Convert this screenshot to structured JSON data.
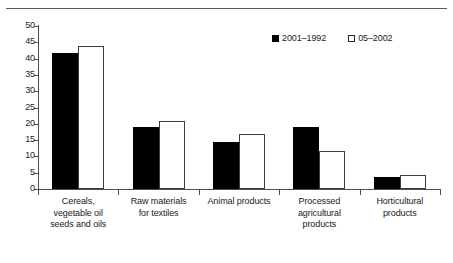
{
  "chart_data": {
    "type": "bar",
    "title": "",
    "subtitle": "",
    "xlabel": "",
    "ylabel": "",
    "ylim": [
      0,
      50
    ],
    "yticks": [
      0,
      5,
      10,
      15,
      20,
      25,
      30,
      35,
      40,
      45,
      50
    ],
    "ytick_labels": [
      "0",
      "5",
      "10",
      "15",
      "20",
      "25",
      "30",
      "35",
      "40",
      "45",
      "50"
    ],
    "grid": false,
    "legend_position": "top-right",
    "categories": [
      "Cereals, vegetable oil seeds and oils",
      "Raw materials for textiles",
      "Animal products",
      "Processed agricultural products",
      "Horticultural products"
    ],
    "category_label_lines": [
      [
        "Cereals,",
        "vegetable oil",
        "seeds and oils"
      ],
      [
        "Raw materials",
        "for textiles"
      ],
      [
        "Animal products"
      ],
      [
        "Processed",
        "agricultural",
        "products"
      ],
      [
        "Horticultural",
        "products"
      ]
    ],
    "series": [
      {
        "name": "2001–1992",
        "color": "#000000",
        "style": "filled",
        "values": [
          41.7,
          18.9,
          14.4,
          19.1,
          3.6
        ]
      },
      {
        "name": "05–2002",
        "color": "#ffffff",
        "style": "outlined",
        "values": [
          44.0,
          20.9,
          17.0,
          11.6,
          4.2
        ]
      }
    ]
  },
  "legend": {
    "items": [
      {
        "label": "2001–1992",
        "swatch": "filled-square-icon"
      },
      {
        "label": "05–2002",
        "swatch": "outlined-square-icon"
      }
    ]
  },
  "axes": {
    "y_tick_labels": [
      "50",
      "45",
      "40",
      "35",
      "30",
      "25",
      "20",
      "15",
      "10",
      "5",
      "0"
    ]
  }
}
